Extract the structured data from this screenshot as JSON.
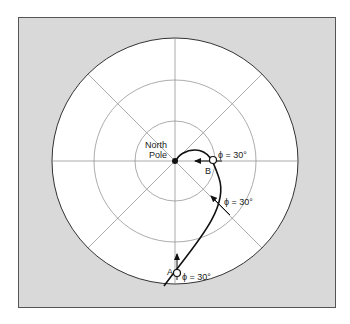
{
  "diagram": {
    "type": "polar-projection",
    "colors": {
      "frame_bg": "#d9d9d9",
      "frame_border": "#555555",
      "disk_fill": "#ffffff",
      "disk_stroke": "#333333",
      "grid": "#888888",
      "path": "#111111"
    },
    "labels": {
      "pole_line1": "North",
      "pole_line2": "Pole",
      "point_b": "B",
      "point_a": "A",
      "angle_b": "ϕ = 30°",
      "angle_mid": "ϕ = 30°",
      "angle_a": "ϕ = 30°"
    },
    "rings": 3,
    "meridians": 8,
    "points": [
      {
        "id": "north-pole",
        "label": "North Pole",
        "kind": "filled"
      },
      {
        "id": "B",
        "label": "B",
        "kind": "open"
      },
      {
        "id": "A",
        "label": "A",
        "kind": "open"
      }
    ]
  }
}
